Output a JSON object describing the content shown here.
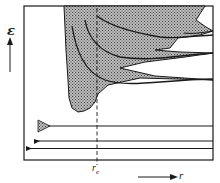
{
  "figure": {
    "type": "potential-energy-diagram",
    "y_axis_label": "ε",
    "x_axis_label": "r",
    "equilibrium_marker_label": "r",
    "equilibrium_marker_subscript": "e",
    "shaded_region": "continuum / allowed region (cross-hatched)",
    "curves": [
      "curve-1",
      "curve-2",
      "curve-3",
      "curve-4"
    ],
    "levels": [
      "level-upper",
      "level-middle",
      "level-lower"
    ]
  },
  "colors": {
    "ink": "#1a1a1a",
    "hatch_dark": "#444444",
    "hatch_light": "#bdbdbd",
    "background": "#ffffff"
  }
}
